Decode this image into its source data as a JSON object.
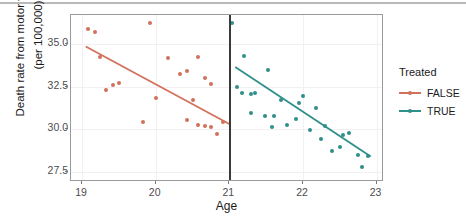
{
  "chart_data": {
    "type": "scatter",
    "title": "",
    "xlabel": "Age",
    "ylabel_line1": "Death rate from motor vehicle fatalities",
    "ylabel_line2": "(per 100,000)",
    "xlim": [
      18.85,
      23.1
    ],
    "ylim": [
      26.9,
      36.7
    ],
    "xticks": [
      19,
      20,
      21,
      22,
      23
    ],
    "xticklabels": [
      "19",
      "20",
      "21",
      "22",
      "23"
    ],
    "yticks": [
      27.5,
      30.0,
      32.5,
      35.0
    ],
    "yticklabels": [
      "27.5",
      "32.5",
      "30.0",
      "35.0"
    ],
    "ytick_display": [
      "35.0",
      "32.5",
      "30.0",
      "27.5"
    ],
    "grid": true,
    "legend_position": "right",
    "annotations": [
      {
        "name": "cutoff-line",
        "type": "vline",
        "x": 21,
        "color": "#3a3a3a"
      }
    ],
    "series": [
      {
        "name": "FALSE",
        "legend_label": "FALSE",
        "color": "#d1715b",
        "points": [
          {
            "x": 19.08,
            "y": 35.85
          },
          {
            "x": 19.17,
            "y": 35.72
          },
          {
            "x": 19.25,
            "y": 34.25
          },
          {
            "x": 19.33,
            "y": 32.3
          },
          {
            "x": 19.42,
            "y": 32.62
          },
          {
            "x": 19.5,
            "y": 32.7
          },
          {
            "x": 19.83,
            "y": 30.45
          },
          {
            "x": 19.92,
            "y": 36.25
          },
          {
            "x": 20.0,
            "y": 31.85
          },
          {
            "x": 20.17,
            "y": 34.2
          },
          {
            "x": 20.33,
            "y": 33.25
          },
          {
            "x": 20.42,
            "y": 33.4
          },
          {
            "x": 20.5,
            "y": 31.7
          },
          {
            "x": 20.58,
            "y": 34.25
          },
          {
            "x": 20.67,
            "y": 33.0
          },
          {
            "x": 20.75,
            "y": 32.65
          },
          {
            "x": 20.42,
            "y": 30.55
          },
          {
            "x": 20.58,
            "y": 30.25
          },
          {
            "x": 20.67,
            "y": 30.2
          },
          {
            "x": 20.75,
            "y": 30.1
          },
          {
            "x": 20.83,
            "y": 29.7
          },
          {
            "x": 20.92,
            "y": 30.4
          }
        ],
        "fit": {
          "x0": 19.05,
          "y0": 34.85,
          "x1": 21.0,
          "y1": 30.3
        }
      },
      {
        "name": "TRUE",
        "legend_label": "TRUE",
        "color": "#2f8f8a",
        "points": [
          {
            "x": 21.03,
            "y": 36.25
          },
          {
            "x": 21.2,
            "y": 34.3
          },
          {
            "x": 21.1,
            "y": 32.45
          },
          {
            "x": 21.17,
            "y": 32.15
          },
          {
            "x": 21.3,
            "y": 32.05
          },
          {
            "x": 21.35,
            "y": 32.1
          },
          {
            "x": 21.52,
            "y": 33.5
          },
          {
            "x": 21.3,
            "y": 30.95
          },
          {
            "x": 21.48,
            "y": 30.8
          },
          {
            "x": 21.6,
            "y": 30.75
          },
          {
            "x": 21.7,
            "y": 31.7
          },
          {
            "x": 21.58,
            "y": 30.15
          },
          {
            "x": 21.78,
            "y": 30.25
          },
          {
            "x": 21.95,
            "y": 31.55
          },
          {
            "x": 22.0,
            "y": 31.95
          },
          {
            "x": 21.9,
            "y": 30.6
          },
          {
            "x": 22.17,
            "y": 31.25
          },
          {
            "x": 22.1,
            "y": 29.95
          },
          {
            "x": 22.3,
            "y": 30.2
          },
          {
            "x": 22.25,
            "y": 29.4
          },
          {
            "x": 22.55,
            "y": 29.65
          },
          {
            "x": 22.62,
            "y": 29.75
          },
          {
            "x": 22.4,
            "y": 28.7
          },
          {
            "x": 22.5,
            "y": 28.95
          },
          {
            "x": 22.75,
            "y": 28.5
          },
          {
            "x": 22.88,
            "y": 28.45
          },
          {
            "x": 22.8,
            "y": 27.8
          }
        ],
        "fit": {
          "x0": 21.08,
          "y0": 33.65,
          "x1": 22.92,
          "y1": 28.4
        }
      }
    ]
  },
  "legend": {
    "title": "Treated",
    "entries": [
      {
        "label": "FALSE",
        "color": "#d1715b"
      },
      {
        "label": "TRUE",
        "color": "#2f8f8a"
      }
    ]
  }
}
